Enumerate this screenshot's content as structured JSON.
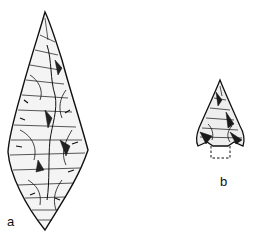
{
  "figure": {
    "items": [
      {
        "id": "a",
        "label": "a",
        "description": "Leaf-shaped bifacially flaked stone point"
      },
      {
        "id": "b",
        "label": "b",
        "description": "Small barbed triangular stone arrowhead with dashed tang outline"
      }
    ],
    "colors": {
      "ink": "#111111",
      "background": "#ffffff"
    }
  }
}
